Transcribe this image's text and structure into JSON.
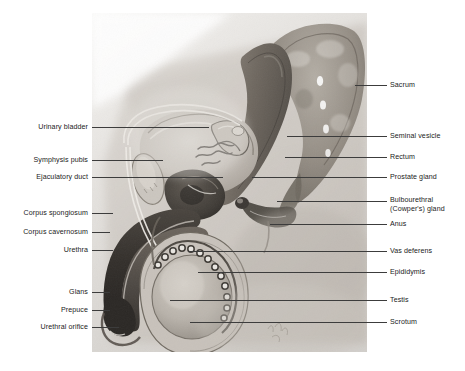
{
  "figure": {
    "plate": {
      "left": 92,
      "top": 13,
      "width": 275,
      "height": 339,
      "background_color": "#f2f1ef",
      "ink_color": "#3a3a3a"
    },
    "line_color": "#3c3c3c",
    "text_color": "#1b1b1b"
  },
  "labels_left": [
    {
      "text": "Urinary bladder",
      "name": "label-urinary-bladder",
      "text_x": 88,
      "text_y": 127,
      "line_x1": 92,
      "line_x2": 209,
      "line_y": 127
    },
    {
      "text": "Symphysis pubis",
      "name": "label-symphysis-pubis",
      "text_x": 88,
      "text_y": 160,
      "line_x1": 92,
      "line_x2": 163,
      "line_y": 160
    },
    {
      "text": "Ejaculatory duct",
      "name": "label-ejaculatory-duct",
      "text_x": 88,
      "text_y": 177,
      "line_x1": 92,
      "line_x2": 223,
      "line_y": 177
    },
    {
      "text": "Corpus spongiosum",
      "name": "label-corpus-spongiosum",
      "text_x": 88,
      "text_y": 213,
      "line_x1": 92,
      "line_x2": 113,
      "line_y": 213
    },
    {
      "text": "Corpus cavernosum",
      "name": "label-corpus-cavernosum",
      "text_x": 88,
      "text_y": 232,
      "line_x1": 92,
      "line_x2": 110,
      "line_y": 232
    },
    {
      "text": "Urethra",
      "name": "label-urethra",
      "text_x": 88,
      "text_y": 250,
      "line_x1": 92,
      "line_x2": 113,
      "line_y": 250
    },
    {
      "text": "Glans",
      "name": "label-glans",
      "text_x": 88,
      "text_y": 292,
      "line_x1": 92,
      "line_x2": 110,
      "line_y": 292
    },
    {
      "text": "Prepuce",
      "name": "label-prepuce",
      "text_x": 88,
      "text_y": 310,
      "line_x1": 92,
      "line_x2": 110,
      "line_y": 310
    },
    {
      "text": "Urethral orifice",
      "name": "label-urethral-orifice",
      "text_x": 88,
      "text_y": 327,
      "line_x1": 92,
      "line_x2": 119,
      "line_y": 327
    }
  ],
  "labels_right": [
    {
      "text": "Sacrum",
      "name": "label-sacrum",
      "text_x": 390,
      "text_y": 85,
      "line_x1": 355,
      "line_x2": 387,
      "line_y": 85
    },
    {
      "text": "Seminal vesicle",
      "name": "label-seminal-vesicle",
      "text_x": 390,
      "text_y": 136,
      "line_x1": 287,
      "line_x2": 387,
      "line_y": 136
    },
    {
      "text": "Rectum",
      "name": "label-rectum",
      "text_x": 390,
      "text_y": 157,
      "line_x1": 285,
      "line_x2": 387,
      "line_y": 157
    },
    {
      "text": "Prostate gland",
      "name": "label-prostate-gland",
      "text_x": 390,
      "text_y": 177,
      "line_x1": 252,
      "line_x2": 387,
      "line_y": 177
    },
    {
      "text": "Anus",
      "name": "label-anus",
      "text_x": 390,
      "text_y": 224,
      "line_x1": 270,
      "line_x2": 387,
      "line_y": 224
    },
    {
      "text": "Vas deferens",
      "name": "label-vas-deferens",
      "text_x": 390,
      "text_y": 251,
      "line_x1": 188,
      "line_x2": 387,
      "line_y": 251
    },
    {
      "text": "Epididymis",
      "name": "label-epididymis",
      "text_x": 390,
      "text_y": 272,
      "line_x1": 198,
      "line_x2": 387,
      "line_y": 272
    },
    {
      "text": "Testis",
      "name": "label-testis",
      "text_x": 390,
      "text_y": 300,
      "line_x1": 170,
      "line_x2": 387,
      "line_y": 300
    },
    {
      "text": "Scrotum",
      "name": "label-scrotum",
      "text_x": 390,
      "text_y": 322,
      "line_x1": 190,
      "line_x2": 387,
      "line_y": 322
    }
  ],
  "labels_right_multiline": [
    {
      "name": "label-bulbourethral-gland",
      "line1": "Bulbourethral",
      "line2": "(Cowper's) gland",
      "text_x": 390,
      "text_y": 205,
      "line_x1": 277,
      "line_x2": 387,
      "line_y": 201
    }
  ],
  "anatomy_parts": [
    "sacrum",
    "rectum",
    "seminal vesicle",
    "prostate gland",
    "urinary bladder",
    "symphysis pubis",
    "ejaculatory duct",
    "bulbourethral (Cowper's) gland",
    "anus",
    "vas deferens",
    "epididymis",
    "testis",
    "scrotum",
    "corpus spongiosum",
    "corpus cavernosum",
    "urethra",
    "glans",
    "prepuce",
    "urethral orifice"
  ]
}
